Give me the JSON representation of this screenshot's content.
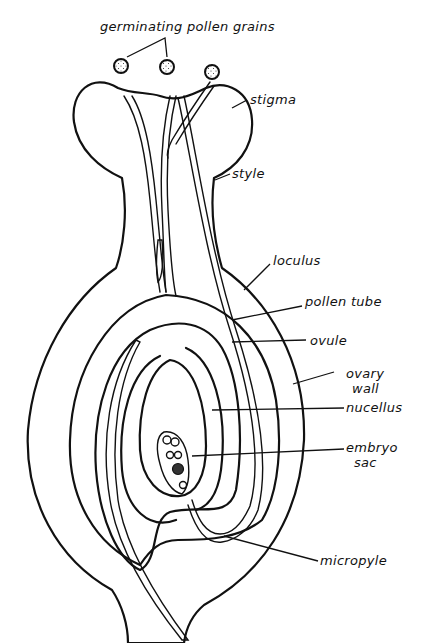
{
  "diagram": {
    "labels": {
      "germinating_pollen_grains": "germinating pollen grains",
      "stigma": "stigma",
      "style": "style",
      "loculus": "loculus",
      "pollen_tube": "pollen tube",
      "ovule": "ovule",
      "ovary_wall_1": "ovary",
      "ovary_wall_2": "wall",
      "nucellus": "nucellus",
      "embryo_sac_1": "embryo",
      "embryo_sac_2": "sac",
      "micropyle": "micropyle"
    },
    "colors": {
      "ink": "#111111",
      "background": "#ffffff"
    }
  }
}
